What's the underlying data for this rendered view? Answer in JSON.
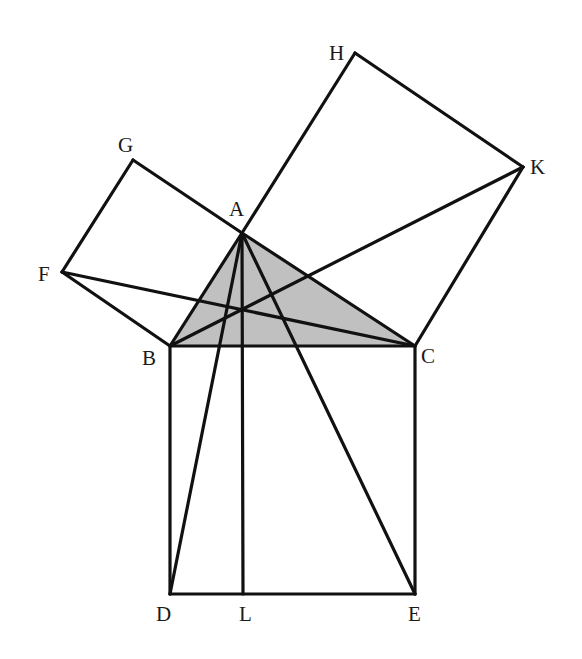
{
  "diagram": {
    "colors": {
      "stroke": "#111111",
      "triangle_fill": "#c0c0c0",
      "background": "#ffffff",
      "label": "#1a1a1a"
    },
    "points": {
      "A": {
        "x": 242,
        "y": 233,
        "label": "A",
        "lx": 229,
        "ly": 216
      },
      "B": {
        "x": 170,
        "y": 346,
        "label": "B",
        "lx": 142,
        "ly": 365
      },
      "C": {
        "x": 415,
        "y": 346,
        "label": "C",
        "lx": 421,
        "ly": 363
      },
      "D": {
        "x": 170,
        "y": 594,
        "label": "D",
        "lx": 156,
        "ly": 621
      },
      "E": {
        "x": 415,
        "y": 594,
        "label": "E",
        "lx": 408,
        "ly": 621
      },
      "L": {
        "x": 243,
        "y": 594,
        "label": "L",
        "lx": 239,
        "ly": 621
      },
      "F": {
        "x": 62,
        "y": 272,
        "label": "F",
        "lx": 38,
        "ly": 281
      },
      "G": {
        "x": 133,
        "y": 160,
        "label": "G",
        "lx": 118,
        "ly": 152
      },
      "H": {
        "x": 355,
        "y": 53,
        "label": "H",
        "lx": 329,
        "ly": 60
      },
      "K": {
        "x": 523,
        "y": 167,
        "label": "K",
        "lx": 530,
        "ly": 174
      }
    },
    "shaded_triangle": [
      "A",
      "B",
      "C"
    ],
    "segments": [
      [
        "A",
        "B"
      ],
      [
        "B",
        "C"
      ],
      [
        "C",
        "A"
      ],
      [
        "B",
        "D"
      ],
      [
        "D",
        "E"
      ],
      [
        "E",
        "C"
      ],
      [
        "A",
        "G"
      ],
      [
        "G",
        "F"
      ],
      [
        "F",
        "B"
      ],
      [
        "A",
        "H"
      ],
      [
        "H",
        "K"
      ],
      [
        "K",
        "C"
      ],
      [
        "A",
        "D"
      ],
      [
        "A",
        "E"
      ],
      [
        "A",
        "L"
      ],
      [
        "F",
        "C"
      ],
      [
        "B",
        "K"
      ]
    ]
  }
}
